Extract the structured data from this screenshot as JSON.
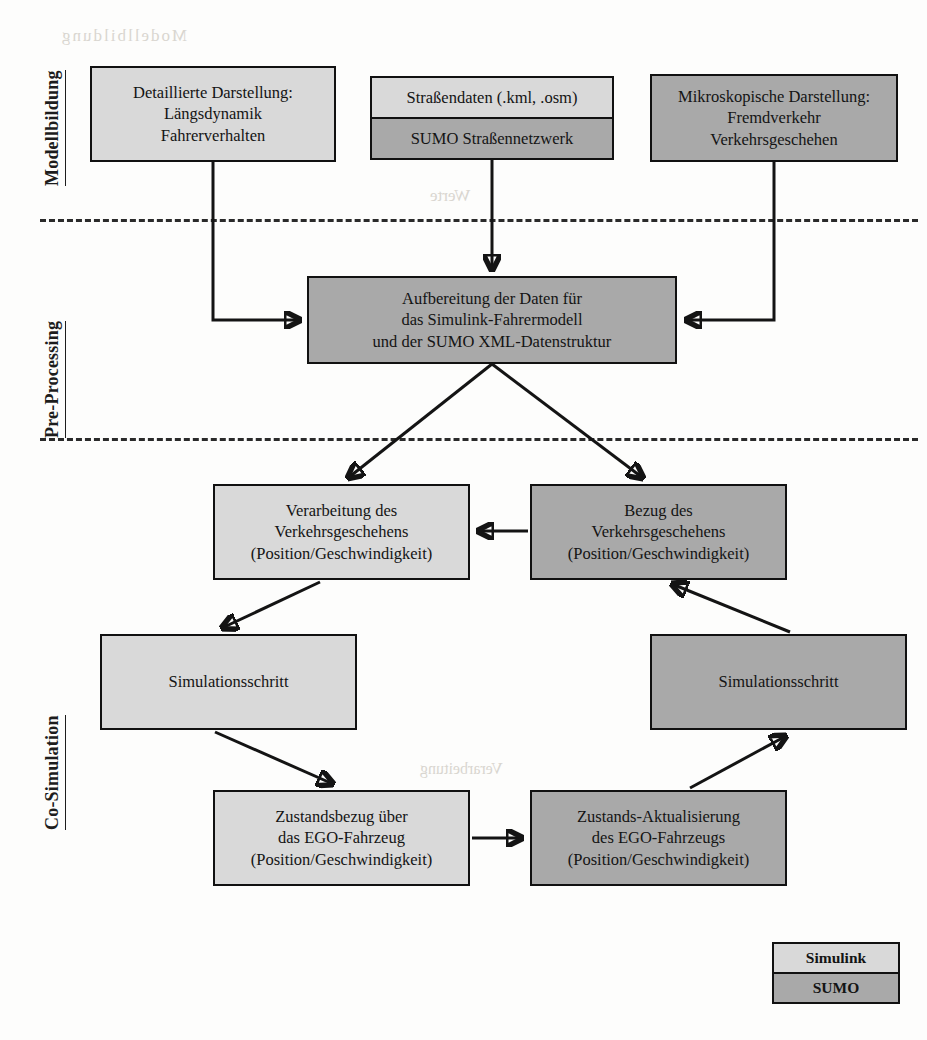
{
  "diagram": {
    "colors": {
      "simulink_fill": "#d9d9d9",
      "sumo_fill": "#a9a9a9",
      "stroke": "#141414",
      "background": "#fdfdfc"
    }
  },
  "sections": [
    {
      "id": "modellbildung",
      "label": "Modellbildung"
    },
    {
      "id": "pre_processing",
      "label": "Pre-Processing"
    },
    {
      "id": "co_simulation",
      "label": "Co-Simulation"
    }
  ],
  "boxes": {
    "detaillierte_darstellung": {
      "lines": [
        "Detaillierte Darstellung:",
        "Längsdynamik",
        "Fahrerverhalten"
      ],
      "line1": "Detaillierte Darstellung:",
      "line2": "Längsdynamik",
      "line3": "Fahrerverhalten",
      "fill": "simulink"
    },
    "strassendaten": {
      "top": "Straßendaten (.kml, .osm)",
      "bottom": "SUMO Straßennetzwerk",
      "fill": "split"
    },
    "mikroskopische_darstellung": {
      "line1": "Mikroskopische Darstellung:",
      "line2": "Fremdverkehr",
      "line3": "Verkehrsgeschehen",
      "fill": "sumo"
    },
    "aufbereitung": {
      "line1": "Aufbereitung der Daten für",
      "line2": "das Simulink-Fahrermodell",
      "line3": "und der SUMO XML-Datenstruktur",
      "fill": "sumo"
    },
    "verarbeitung_verkehr": {
      "line1": "Verarbeitung des",
      "line2": "Verkehrsgeschehens",
      "line3": "(Position/Geschwindigkeit)",
      "fill": "simulink"
    },
    "bezug_verkehr": {
      "line1": "Bezug des",
      "line2": "Verkehrsgeschehens",
      "line3": "(Position/Geschwindigkeit)",
      "fill": "sumo"
    },
    "simulationsschritt_links": {
      "line1": "Simulationsschritt",
      "fill": "simulink"
    },
    "simulationsschritt_rechts": {
      "line1": "Simulationsschritt",
      "fill": "sumo"
    },
    "zustandsbezug": {
      "line1": "Zustandsbezug über",
      "line2": "das EGO-Fahrzeug",
      "line3": "(Position/Geschwindigkeit)",
      "fill": "simulink"
    },
    "zustands_aktualisierung": {
      "line1": "Zustands-Aktualisierung",
      "line2": "des EGO-Fahrzeugs",
      "line3": "(Position/Geschwindigkeit)",
      "fill": "sumo"
    }
  },
  "legend": {
    "simulink_label": "Simulink",
    "sumo_label": "SUMO"
  },
  "bleed": {
    "t1": "Modellbildung",
    "t2": "Werte",
    "t3": "Typ",
    "t4": "Energie",
    "t5": "Ausgabe",
    "t6": "Verarbeitung"
  }
}
